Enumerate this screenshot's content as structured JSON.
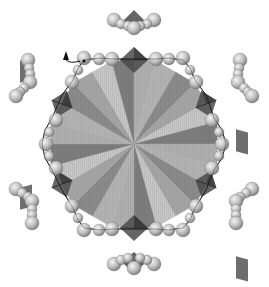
{
  "figure": {
    "type": "molecular-structure-rendering",
    "background": "#ffffff",
    "center": [
      134,
      144
    ],
    "central_polygon": {
      "shape": "dodecagon",
      "radius": 86,
      "wedge_count": 24,
      "wedge_shades": [
        "#b4b4b4",
        "#8c8c8c",
        "#a6a6a6",
        "#c6c6c6",
        "#7e7e7e",
        "#b0b0b0"
      ]
    },
    "ring": {
      "sphere_color_light": "#f2f2f2",
      "sphere_color_mid": "#bdbdbd",
      "sphere_color_dark": "#7a7a7a",
      "line_color": "#222222"
    },
    "octahedra_color": "#4a4a4a",
    "arrow_marker": {
      "x": 66,
      "y": 56,
      "direction": "up"
    },
    "satellite_clusters": [
      {
        "name": "top",
        "x": 134,
        "y": 22,
        "orientation": "down"
      },
      {
        "name": "bottom",
        "x": 134,
        "y": 262,
        "orientation": "up"
      },
      {
        "name": "upper-left",
        "x": 28,
        "y": 78,
        "orientation": "diag"
      },
      {
        "name": "upper-right",
        "x": 240,
        "y": 78,
        "orientation": "diag"
      },
      {
        "name": "lower-left",
        "x": 28,
        "y": 205,
        "orientation": "diag"
      },
      {
        "name": "lower-right",
        "x": 240,
        "y": 205,
        "orientation": "diag"
      }
    ]
  }
}
